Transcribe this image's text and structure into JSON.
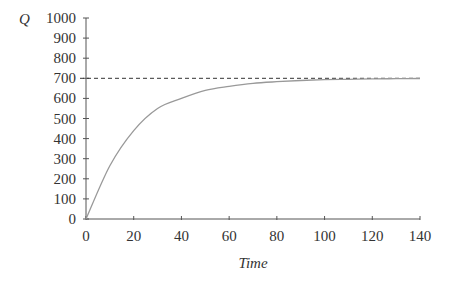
{
  "chart_data": {
    "type": "line",
    "title": "",
    "xlabel": "Time",
    "ylabel": "Q",
    "xlim": [
      0,
      140
    ],
    "ylim": [
      0,
      1000
    ],
    "x_ticks": [
      "0",
      "20",
      "40",
      "60",
      "80",
      "100",
      "120",
      "140"
    ],
    "y_ticks": [
      "0",
      "100",
      "200",
      "300",
      "400",
      "500",
      "600",
      "700",
      "800",
      "900",
      "1000"
    ],
    "grid": false,
    "legend": null,
    "series": [
      {
        "name": "Q(t)",
        "style": "solid",
        "color": "#999999",
        "x": [
          0,
          10,
          20,
          30,
          40,
          50,
          60,
          70,
          80,
          90,
          100,
          110,
          120,
          130,
          140
        ],
        "y": [
          0,
          265,
          440,
          550,
          600,
          640,
          660,
          675,
          683,
          689,
          693,
          695,
          697,
          698,
          699
        ]
      },
      {
        "name": "asymptote",
        "style": "dashed",
        "color": "#333333",
        "y_const": 700
      }
    ]
  }
}
